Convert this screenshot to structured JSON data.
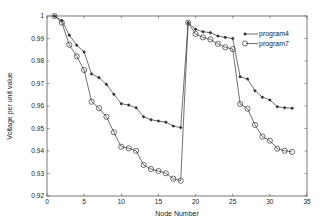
{
  "chart_data": {
    "type": "line",
    "title": "",
    "xlabel": "Node Number",
    "ylabel": "Voltage per unit value",
    "xlim": [
      0,
      35
    ],
    "ylim": [
      0.92,
      1.0
    ],
    "xticks": [
      0,
      5,
      10,
      15,
      20,
      25,
      30,
      35
    ],
    "yticks": [
      0.92,
      0.93,
      0.94,
      0.95,
      0.96,
      0.97,
      0.98,
      0.99,
      1
    ],
    "ytick_labels": [
      "0.92",
      "0.93",
      "0.94",
      "0.95",
      "0.96",
      "0.97",
      "0.98",
      "0.99",
      "1"
    ],
    "grid": false,
    "legend_position": "upper right (inside)",
    "x": [
      1,
      2,
      3,
      4,
      5,
      6,
      7,
      8,
      9,
      10,
      11,
      12,
      13,
      14,
      15,
      16,
      17,
      18,
      19,
      20,
      21,
      22,
      23,
      24,
      25,
      26,
      27,
      28,
      29,
      30,
      31,
      32,
      33
    ],
    "series": [
      {
        "name": "program4",
        "marker": "*",
        "values": [
          1.0,
          0.998,
          0.9915,
          0.987,
          0.984,
          0.9742,
          0.9726,
          0.9696,
          0.9652,
          0.961,
          0.9604,
          0.9592,
          0.9552,
          0.9539,
          0.9533,
          0.9528,
          0.9511,
          0.9504,
          0.997,
          0.9941,
          0.993,
          0.9926,
          0.9911,
          0.9905,
          0.99,
          0.973,
          0.972,
          0.9668,
          0.9639,
          0.9627,
          0.9597,
          0.9592,
          0.959
        ]
      },
      {
        "name": "program7",
        "marker": "o",
        "values": [
          1.0,
          0.997,
          0.9872,
          0.9821,
          0.976,
          0.9619,
          0.959,
          0.9552,
          0.9483,
          0.9419,
          0.9412,
          0.9401,
          0.9338,
          0.932,
          0.9311,
          0.9301,
          0.9277,
          0.9268,
          0.997,
          0.992,
          0.9905,
          0.9896,
          0.9876,
          0.9861,
          0.9853,
          0.9609,
          0.9588,
          0.9516,
          0.9464,
          0.9446,
          0.941,
          0.9401,
          0.9396
        ]
      }
    ]
  },
  "legend": {
    "items": [
      {
        "label": "program4",
        "marker": "*"
      },
      {
        "label": "program7",
        "marker": "o"
      }
    ]
  },
  "colors": {
    "line": "#333333",
    "axis": "#444444"
  }
}
